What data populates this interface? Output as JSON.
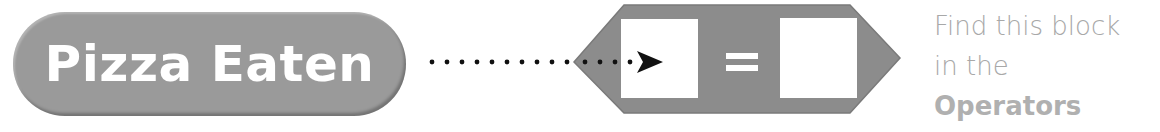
{
  "variable_block": {
    "label": "Pizza Eaten",
    "color": "#9a9a9a"
  },
  "connector": {
    "style": "dotted-arrow",
    "icon": "arrow-right-icon"
  },
  "operator_block": {
    "operator": "=",
    "left_slot": "",
    "right_slot": "",
    "color": "#8c8c8c"
  },
  "caption": {
    "line1": "Find this block",
    "line2_prefix": "in the ",
    "line2_bold": "Operators",
    "line3": "category."
  }
}
